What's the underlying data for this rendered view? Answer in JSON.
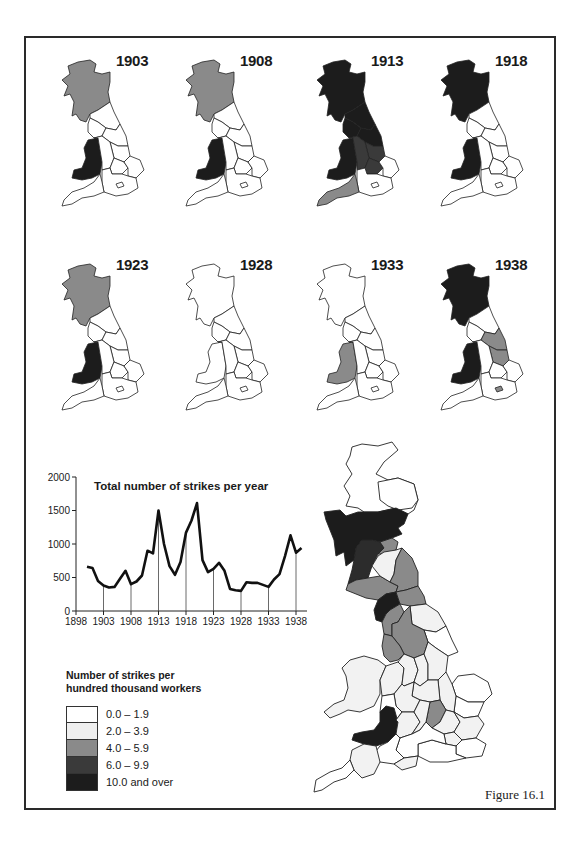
{
  "figure": {
    "label": "Figure 16.1"
  },
  "small_maps": [
    {
      "year": "1903",
      "scotland": "4.0 – 5.9",
      "wales": "10.0 and over",
      "north_england": "0.0 – 1.9",
      "south_west": "0.0 – 1.9"
    },
    {
      "year": "1908",
      "scotland": "4.0 – 5.9",
      "wales": "10.0 and over",
      "north_england": "0.0 – 1.9",
      "south_west": "0.0 – 1.9"
    },
    {
      "year": "1913",
      "scotland": "10.0 and over",
      "wales": "10.0 and over",
      "north_england": "10.0 and over",
      "midlands": "6.0 – 9.9",
      "south_west": "4.0 – 5.9"
    },
    {
      "year": "1918",
      "scotland": "10.0 and over",
      "wales": "10.0 and over",
      "north_england": "0.0 – 1.9",
      "south_west": "0.0 – 1.9"
    },
    {
      "year": "1923",
      "scotland": "4.0 – 5.9",
      "wales": "10.0 and over",
      "north_england": "0.0 – 1.9",
      "south_west": "0.0 – 1.9"
    },
    {
      "year": "1928",
      "scotland": "0.0 – 1.9",
      "wales": "0.0 – 1.9",
      "north_england": "0.0 – 1.9",
      "south_west": "0.0 – 1.9"
    },
    {
      "year": "1933",
      "scotland": "0.0 – 1.9",
      "wales": "4.0 – 5.9",
      "north_england": "0.0 – 1.9",
      "south_west": "0.0 – 1.9"
    },
    {
      "year": "1938",
      "scotland": "10.0 and over",
      "wales": "10.0 and over",
      "north_east": "4.0 – 5.9",
      "yorkshire": "4.0 – 5.9",
      "london": "4.0 – 5.9"
    }
  ],
  "legend": {
    "title_line1": "Number of strikes per",
    "title_line2": "hundred thousand workers",
    "items": [
      {
        "label": "0.0 – 1.9",
        "color": "#ffffff"
      },
      {
        "label": "2.0 – 3.9",
        "color": "#efefef"
      },
      {
        "label": "4.0 – 5.9",
        "color": "#8a8a8a"
      },
      {
        "label": "6.0 – 9.9",
        "color": "#3a3a3a"
      },
      {
        "label": "10.0 and over",
        "color": "#1c1c1c"
      }
    ]
  },
  "chart_data": {
    "type": "line",
    "title": "Total number of strikes per year",
    "xlabel": "",
    "ylabel": "",
    "x": [
      1900,
      1901,
      1902,
      1903,
      1904,
      1905,
      1906,
      1907,
      1908,
      1909,
      1910,
      1911,
      1912,
      1913,
      1914,
      1915,
      1916,
      1917,
      1918,
      1919,
      1920,
      1921,
      1922,
      1923,
      1924,
      1925,
      1926,
      1927,
      1928,
      1929,
      1930,
      1931,
      1932,
      1933,
      1934,
      1935,
      1936,
      1937,
      1938,
      1939
    ],
    "series": [
      {
        "name": "Total number of strikes per year",
        "values": [
          660,
          640,
          450,
          380,
          350,
          360,
          480,
          600,
          400,
          440,
          530,
          900,
          860,
          1500,
          1000,
          670,
          540,
          730,
          1170,
          1350,
          1610,
          760,
          580,
          630,
          720,
          600,
          330,
          310,
          300,
          430,
          420,
          420,
          390,
          360,
          470,
          550,
          820,
          1130,
          870,
          940
        ]
      }
    ],
    "xticks": [
      "1898",
      "1903",
      "1908",
      "1913",
      "1918",
      "1923",
      "1928",
      "1933",
      "1938"
    ],
    "yticks": [
      "0",
      "500",
      "1000",
      "1500",
      "2000"
    ],
    "xlim": [
      1898,
      1940
    ],
    "ylim": [
      0,
      2000
    ],
    "grid": false,
    "drop_lines_at": [
      1903,
      1908,
      1913,
      1918,
      1923,
      1928,
      1933,
      1938
    ],
    "legend_position": "none"
  }
}
